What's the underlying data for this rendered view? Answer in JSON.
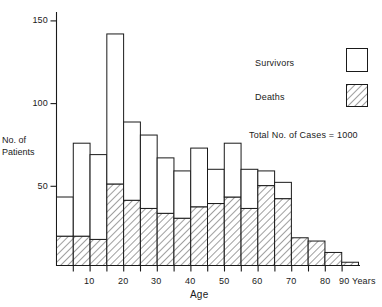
{
  "chart_data": {
    "type": "bar",
    "title": "",
    "subtitle": "",
    "xlabel": "Age",
    "ylabel_lines": [
      "No. of",
      "Patients"
    ],
    "x_unit_label": "Years",
    "xlim": [
      0,
      90
    ],
    "ylim": [
      0,
      155
    ],
    "xticks_major": [
      10,
      20,
      30,
      40,
      50,
      60,
      70,
      80,
      90
    ],
    "xticks_minor": [
      5,
      15,
      25,
      35,
      45,
      55,
      65,
      75,
      85
    ],
    "xtick_labels": [
      "10",
      "20",
      "30",
      "40",
      "50",
      "60",
      "70",
      "80",
      "90"
    ],
    "yticks": [
      50,
      100,
      150
    ],
    "ytick_labels": [
      "50",
      "100",
      "150"
    ],
    "grid": false,
    "legend_position": "upper-right",
    "stacked": true,
    "bin_width": 5,
    "bin_starts": [
      0,
      5,
      10,
      15,
      20,
      25,
      30,
      35,
      40,
      45,
      50,
      55,
      60,
      65,
      70,
      75,
      80,
      85
    ],
    "categories": [
      "0-5",
      "5-10",
      "10-15",
      "15-20",
      "20-25",
      "25-30",
      "30-35",
      "35-40",
      "40-45",
      "45-50",
      "50-55",
      "55-60",
      "60-65",
      "65-70",
      "70-75",
      "75-80",
      "80-85",
      "85-90"
    ],
    "series": [
      {
        "name": "Deaths",
        "fill": "hatched",
        "color": "#ffffff",
        "values": [
          18,
          18,
          16,
          50,
          40,
          35,
          32,
          29,
          36,
          38,
          42,
          35,
          49,
          41,
          17,
          15,
          8,
          2
        ]
      },
      {
        "name": "Survivors",
        "fill": "open",
        "color": "#ffffff",
        "values": [
          24,
          57,
          52,
          92,
          48,
          45,
          34,
          29,
          36,
          21,
          33,
          24,
          9,
          10,
          0,
          0,
          0,
          0
        ]
      }
    ],
    "totals": [
      42,
      75,
      68,
      142,
      88,
      80,
      66,
      58,
      72,
      59,
      75,
      59,
      58,
      51,
      17,
      15,
      8,
      2
    ],
    "annotations": [
      {
        "text": "Total No. of Cases = 1000"
      }
    ]
  },
  "legend": {
    "items": [
      {
        "label": "Survivors",
        "swatch": "open-box"
      },
      {
        "label": "Deaths",
        "swatch": "hatched-box"
      }
    ],
    "note": "Total No. of Cases = 1000"
  },
  "axes": {
    "x_title": "Age",
    "x_unit": "Years",
    "y_title_line1": "No. of",
    "y_title_line2": "Patients",
    "ytick_50": "50",
    "ytick_100": "100",
    "ytick_150": "150",
    "xtick_10": "10",
    "xtick_20": "20",
    "xtick_30": "30",
    "xtick_40": "40",
    "xtick_50": "50",
    "xtick_60": "60",
    "xtick_70": "70",
    "xtick_80": "80",
    "xtick_90": "90"
  },
  "colors": {
    "ink": "#1a1a1a",
    "background": "#ffffff",
    "hatch": "#2a2a2a"
  }
}
